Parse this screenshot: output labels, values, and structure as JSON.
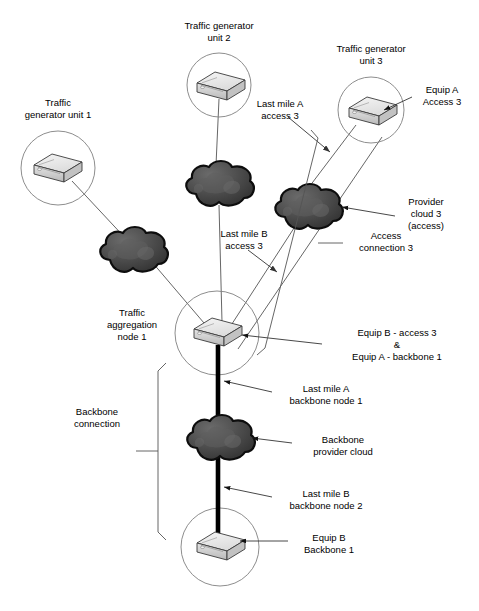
{
  "diagram": {
    "colors": {
      "line": "#555555",
      "text": "#000000",
      "cloud_dark": "#3a3a3a",
      "cloud_mid": "#555555",
      "cloud_outline": "#111111",
      "router_top": "#e9e9e9",
      "router_side": "#c6c6c6",
      "router_front": "#d9d9d9",
      "router_outline": "#333333",
      "backbone_link": "#000000",
      "circle_stroke": "#777777",
      "background": "#ffffff"
    },
    "labels": {
      "traffic_generator_unit_1": "Traffic\ngenerator unit 1",
      "traffic_generator_unit_2": "Traffic generator\nunit 2",
      "traffic_generator_unit_3": "Traffic generator\nunit 3",
      "equip_a_access_3": "Equip A\nAccess 3",
      "last_mile_a_access_3": "Last mile A\naccess 3",
      "last_mile_b_access_3": "Last mile B\naccess 3",
      "provider_cloud_3_access": "Provider\ncloud 3\n(access)",
      "access_connection_3": "Access\nconnection  3",
      "traffic_aggregation_node_1": "Traffic\naggregation\nnode 1",
      "equip_b_access_3_and_equip_a_backbone_1": "Equip B - access 3\n&\nEquip A - backbone 1",
      "last_mile_a_backbone_node_1": "Last mile A\nbackbone node 1",
      "backbone_connection": "Backbone\nconnection",
      "backbone_provider_cloud": "Backbone\nprovider cloud",
      "last_mile_b_backbone_node_2": "Last mile B\nbackbone node 2",
      "equip_b_backbone_1": "Equip B\nBackbone 1"
    },
    "nodes": [
      {
        "id": "generator-1",
        "kind": "router-in-circle",
        "cx": 58,
        "cy": 168,
        "r": 37
      },
      {
        "id": "generator-2",
        "kind": "router-in-circle",
        "cx": 219,
        "cy": 85,
        "r": 32
      },
      {
        "id": "generator-3",
        "kind": "router-in-circle",
        "cx": 371,
        "cy": 110,
        "r": 33
      },
      {
        "id": "aggregation-node-1",
        "kind": "router-in-circle",
        "cx": 217,
        "cy": 333,
        "r": 42
      },
      {
        "id": "equip-b-backbone-1",
        "kind": "router-in-circle",
        "cx": 220,
        "cy": 547,
        "r": 39
      },
      {
        "id": "cloud-access-1",
        "kind": "cloud",
        "cx": 132,
        "cy": 252
      },
      {
        "id": "cloud-access-2",
        "kind": "cloud",
        "cx": 217,
        "cy": 186
      },
      {
        "id": "cloud-access-3",
        "kind": "cloud",
        "cx": 307,
        "cy": 209
      },
      {
        "id": "cloud-backbone",
        "kind": "cloud",
        "cx": 217,
        "cy": 440
      }
    ],
    "icons": {
      "router": "router-icon",
      "cloud": "cloud-icon",
      "circle": "node-circle-icon",
      "arrow": "arrow-head-icon",
      "bracket": "bracket-icon"
    }
  }
}
